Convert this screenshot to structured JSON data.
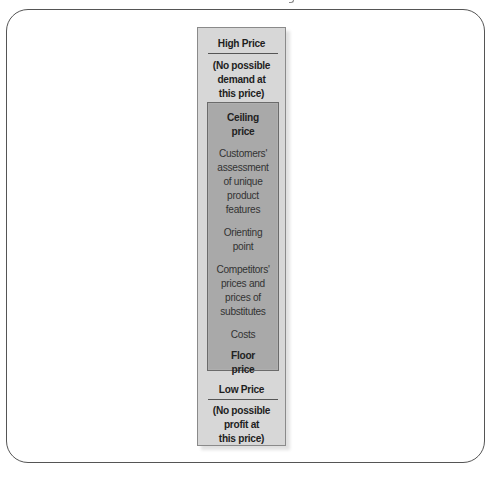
{
  "diagram": {
    "title": "",
    "type": "price-range-scale",
    "top_section": {
      "heading": "High Price",
      "note_lines": [
        "(No possible",
        "demand at",
        "this price)"
      ]
    },
    "range_section": {
      "ceiling_lines": [
        "Ceiling",
        "price"
      ],
      "customers_lines": [
        "Customers'",
        "assessment",
        "of unique",
        "product",
        "features"
      ],
      "orienting_lines": [
        "Orienting",
        "point"
      ],
      "competitors_lines": [
        "Competitors'",
        "prices and",
        "prices of",
        "substitutes"
      ],
      "costs": "Costs",
      "floor_lines": [
        "Floor",
        "price"
      ]
    },
    "bottom_section": {
      "heading": "Low Price",
      "note_lines": [
        "(No possible",
        "profit at",
        "this price)"
      ]
    },
    "colors": {
      "outer_box": "#d7d7d7",
      "inner_box": "#a9a9a9",
      "frame_border": "#555555",
      "text": "#1e1e1e"
    }
  }
}
